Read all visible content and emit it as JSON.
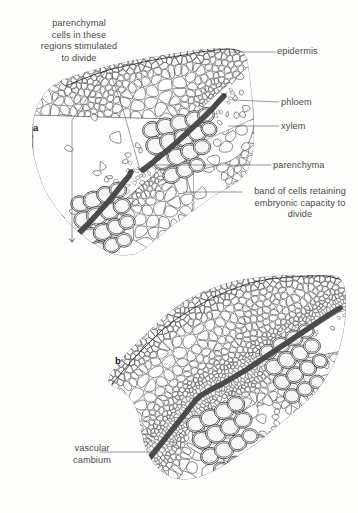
{
  "figure": {
    "background_color": "#fdfdfc",
    "ink_color": "#2b2b2b",
    "cambium_band_color": "#5a5a5a",
    "label_text_color": "#4b4b4b",
    "leader_line_color": "#5d5d5d"
  },
  "panels": [
    {
      "id": "a",
      "letter": "a",
      "description": "Young stem cross-section with two separate vascular bundles, each with its own cambium band; parenchymal cells between bundles are stimulated to divide."
    },
    {
      "id": "b",
      "letter": "b",
      "description": "Older stem cross-section where the bundle cambia have joined into a continuous vascular cambium ring."
    }
  ],
  "labels": {
    "parenchymal_cells": "parenchymal\ncells in these\nregions stimulated\nto divide",
    "epidermis": "epidermis",
    "phloem": "phloem",
    "xylem": "xylem",
    "parenchyma": "parenchyma",
    "band_of_cells": "band of cells retaining\nembryonic capacity to\ndivide",
    "vascular_cambium": "vascular\ncambium"
  },
  "chart_data": {
    "type": "diagram",
    "annotations": [
      "parenchymal cells in these regions stimulated to divide",
      "epidermis",
      "phloem",
      "xylem",
      "parenchyma",
      "band of cells retaining embryonic capacity to divide",
      "vascular cambium"
    ]
  }
}
